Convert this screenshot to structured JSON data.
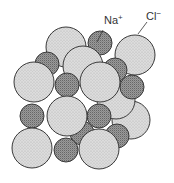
{
  "diagram": {
    "labels": {
      "sodium": {
        "symbol": "Na",
        "charge": "+"
      },
      "chloride": {
        "symbol": "Cl",
        "charge": "−"
      }
    },
    "ion_types": {
      "sodium": {
        "name": "Na+ ion",
        "fill": "#8c8c8c",
        "pattern": "stipple-dark"
      },
      "chloride": {
        "name": "Cl- ion",
        "fill": "#d6d6d6",
        "pattern": "stipple-light"
      }
    },
    "outline_color": "#3a3a3a"
  }
}
